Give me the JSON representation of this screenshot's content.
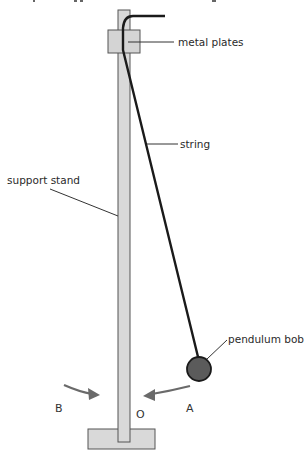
{
  "diagram": {
    "labels": {
      "metal_plates": "metal plates",
      "string": "string",
      "support_stand": "support stand",
      "pendulum_bob": "pendulum bob",
      "point_a": "A",
      "point_b": "B",
      "point_o": "O"
    },
    "colors": {
      "stand_fill": "#d9d9d9",
      "stand_stroke": "#555555",
      "plate_fill": "#d4d4d4",
      "string": "#1a1a1a",
      "bob_fill": "#5b5b5b",
      "bob_stroke": "#1a1a1a",
      "arrow": "#6a6a6a",
      "leader_line": "#333333"
    }
  }
}
